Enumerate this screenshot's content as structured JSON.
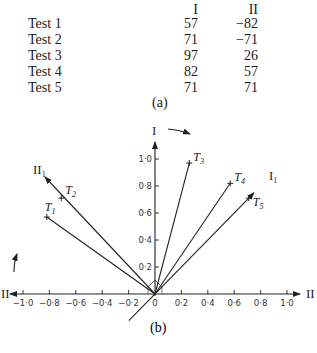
{
  "table": {
    "headers": [
      "I",
      "II"
    ],
    "rows": [
      {
        "label": "Test 1",
        "I": "57",
        "II": "−82"
      },
      {
        "label": "Test 2",
        "I": "71",
        "II": "−71"
      },
      {
        "label": "Test 3",
        "I": "97",
        "II": "26"
      },
      {
        "label": "Test 4",
        "I": "82",
        "II": "57"
      },
      {
        "label": "Test 5",
        "I": "71",
        "II": "71"
      }
    ],
    "caption": "(a)"
  },
  "diagram": {
    "caption": "(b)",
    "vertical_axis_label": "I",
    "horizontal_axis_label": "II",
    "rotated_axis_1_label": "I",
    "rotated_axis_1_sub": "1",
    "rotated_axis_2_label": "II",
    "rotated_axis_2_sub": "1",
    "x_ticks": [
      "−1·0",
      "−0·8",
      "−0·6",
      "−0·4",
      "−0·2",
      "0",
      "0·2",
      "0·4",
      "0·6",
      "0·8",
      "1·0"
    ],
    "x_tick_values": [
      -1.0,
      -0.8,
      -0.6,
      -0.4,
      -0.2,
      0,
      0.2,
      0.4,
      0.6,
      0.8,
      1.0
    ],
    "y_ticks": [
      "0·2",
      "0·4",
      "0·6",
      "0·8",
      "1·0"
    ],
    "y_tick_values": [
      0.2,
      0.4,
      0.6,
      0.8,
      1.0
    ],
    "points": [
      {
        "label": "T",
        "sub": "1",
        "I": 0.57,
        "II": -0.82
      },
      {
        "label": "T",
        "sub": "2",
        "I": 0.71,
        "II": -0.71
      },
      {
        "label": "T",
        "sub": "3",
        "I": 0.97,
        "II": 0.26
      },
      {
        "label": "T",
        "sub": "4",
        "I": 0.82,
        "II": 0.57
      },
      {
        "label": "T",
        "sub": "5",
        "I": 0.71,
        "II": 0.71
      }
    ]
  },
  "chart_data": {
    "type": "scatter",
    "title": "",
    "xlabel": "II",
    "ylabel": "I",
    "xlim": [
      -1.0,
      1.0
    ],
    "ylim": [
      0,
      1.0
    ],
    "points": [
      {
        "name": "T1",
        "x": -0.82,
        "y": 0.57
      },
      {
        "name": "T2",
        "x": -0.71,
        "y": 0.71
      },
      {
        "name": "T3",
        "x": 0.26,
        "y": 0.97
      },
      {
        "name": "T4",
        "x": 0.57,
        "y": 0.82
      },
      {
        "name": "T5",
        "x": 0.71,
        "y": 0.71
      }
    ],
    "rotated_axes": [
      "I1",
      "II1"
    ]
  }
}
